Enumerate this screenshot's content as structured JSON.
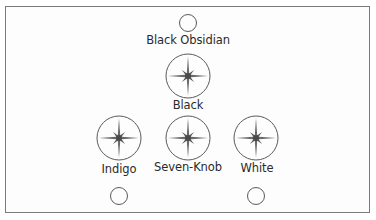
{
  "diagram": {
    "nodes": [
      {
        "id": "black-obsidian",
        "label": "Black Obsidian",
        "type": "empty-circle"
      },
      {
        "id": "black",
        "label": "Black",
        "type": "star-circle"
      },
      {
        "id": "indigo",
        "label": "Indigo",
        "type": "star-circle"
      },
      {
        "id": "seven-knob",
        "label": "Seven-Knob",
        "type": "star-circle"
      },
      {
        "id": "white",
        "label": "White",
        "type": "star-circle"
      },
      {
        "id": "bottom-left",
        "label": "",
        "type": "empty-circle"
      },
      {
        "id": "bottom-right",
        "label": "",
        "type": "empty-circle"
      }
    ],
    "labels": {
      "black_obsidian": "Black Obsidian",
      "black": "Black",
      "indigo": "Indigo",
      "seven_knob": "Seven-Knob",
      "white": "White"
    },
    "colors": {
      "stroke": "#5a5a5a",
      "star": "#6a6a6a",
      "border": "#7a7a7a",
      "text": "#2a2a2a"
    }
  }
}
